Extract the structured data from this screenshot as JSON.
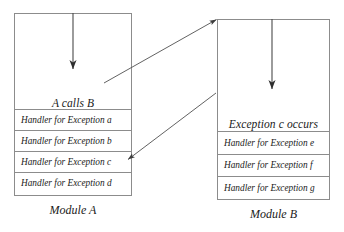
{
  "diagram": {
    "title_module_a": "Module A",
    "title_module_b": "Module B",
    "modules": [
      {
        "id": "module-a",
        "caption": "Module A",
        "body_label": "A calls B",
        "handlers": [
          "Handler for Exception a",
          "Handler for Exception b",
          "Handler for Exception c",
          "Handler for Exception d"
        ]
      },
      {
        "id": "module-b",
        "caption": "Module B",
        "body_label": "Exception c occurs",
        "handlers": [
          "Handler for Exception e",
          "Handler for Exception f",
          "Handler for Exception g"
        ]
      }
    ],
    "arrows": [
      {
        "name": "control-flow-arrow-a",
        "description": "downward flow arrow inside Module A body"
      },
      {
        "name": "control-flow-arrow-b",
        "description": "downward flow arrow inside Module B body"
      },
      {
        "name": "call-arrow-a-to-b",
        "description": "A calls B, pointing to Module B top-left corner"
      },
      {
        "name": "exception-propagation-arrow-b-to-a",
        "description": "Exception c propagates back to Handler for Exception c in Module A"
      }
    ],
    "colors": {
      "border": "#8c8c8c",
      "text": "#1a1a1a",
      "arrow": "#4a4a4a",
      "background": "#ffffff"
    }
  }
}
